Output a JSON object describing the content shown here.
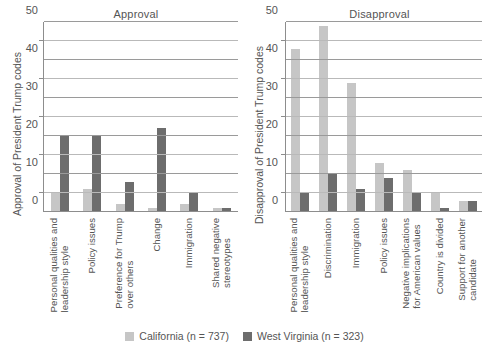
{
  "chart_data": {
    "type": "bar",
    "title": "",
    "panels": [
      {
        "title": "Approval",
        "ylabel": "Approval of President Trump codes",
        "ylim": [
          0,
          50
        ],
        "yticks": [
          0,
          10,
          20,
          30,
          40,
          50
        ],
        "yticks_minor": [
          5,
          15,
          25,
          35,
          45
        ],
        "categories": [
          "Personal qualities and leadership style",
          "Policy issues",
          "Preference for Trump over others",
          "Change",
          "Immigration",
          "Shared negative stereotypes"
        ],
        "categories_lines": [
          [
            "Personal qualities and",
            "leadership style"
          ],
          [
            "Policy issues",
            ""
          ],
          [
            "Preference for Trump",
            "over others"
          ],
          [
            "Change",
            ""
          ],
          [
            "Immigration",
            ""
          ],
          [
            "Shared negative",
            "stereotypes"
          ]
        ],
        "series": [
          {
            "name": "California",
            "values": [
              5,
              6,
              2,
              1,
              2,
              1
            ]
          },
          {
            "name": "West Virginia",
            "values": [
              20,
              20,
              8,
              22,
              5,
              1
            ]
          }
        ]
      },
      {
        "title": "Disapproval",
        "ylabel": "Disapproval of President Trump codes",
        "ylim": [
          0,
          50
        ],
        "yticks": [
          0,
          10,
          20,
          30,
          40,
          50
        ],
        "yticks_minor": [
          5,
          15,
          25,
          35,
          45
        ],
        "categories": [
          "Personal qualities and leadership style",
          "Discrimination",
          "Immigration",
          "Policy issues",
          "Negative implications for American values",
          "Country is divided",
          "Support for another candidate"
        ],
        "categories_lines": [
          [
            "Personal qualities and",
            "leadership style"
          ],
          [
            "Discrimination",
            ""
          ],
          [
            "Immigration",
            ""
          ],
          [
            "Policy issues",
            ""
          ],
          [
            "Negative implications",
            "for American values"
          ],
          [
            "Country is divided",
            ""
          ],
          [
            "Support for another",
            "candidate"
          ]
        ],
        "series": [
          {
            "name": "California",
            "values": [
              43,
              49,
              34,
              13,
              11,
              5,
              3
            ]
          },
          {
            "name": "West Virginia",
            "values": [
              5,
              10,
              6,
              9,
              5,
              1,
              3
            ]
          }
        ]
      }
    ],
    "legend": {
      "position": "bottom",
      "entries": [
        {
          "label": "California (n = 737)",
          "color": "#c6c6c6"
        },
        {
          "label": "West Virginia (n = 323)",
          "color": "#6d6d6d"
        }
      ]
    },
    "grid": true,
    "colors": {
      "california": "#c6c6c6",
      "west_virginia": "#6d6d6d",
      "axis": "#8d8d8d",
      "text": "#555555"
    }
  }
}
